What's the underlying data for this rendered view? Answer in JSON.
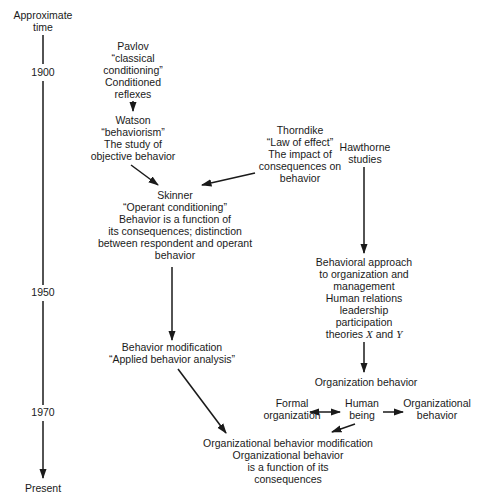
{
  "timeline": {
    "header_line1": "Approximate",
    "header_line2": "time",
    "ticks": [
      {
        "label": "1900",
        "y": 72
      },
      {
        "label": "1950",
        "y": 292
      },
      {
        "label": "1970",
        "y": 412
      }
    ],
    "end_label": "Present"
  },
  "nodes": {
    "pavlov": {
      "lines": [
        "Pavlov",
        "“classical",
        "conditioning”",
        "Conditioned",
        "reflexes"
      ]
    },
    "watson": {
      "lines": [
        "Watson",
        "“behaviorism”",
        "The study of",
        "objective behavior"
      ]
    },
    "thorndike": {
      "lines": [
        "Thorndike",
        "“Law of effect”",
        "The impact of",
        "consequences on",
        "behavior"
      ]
    },
    "hawthorne": {
      "lines": [
        "Hawthorne",
        "studies"
      ]
    },
    "skinner": {
      "lines": [
        "Skinner",
        "“Operant conditioning”",
        "Behavior is a function of",
        "its consequences; distinction",
        "between respondent and operant",
        "behavior"
      ]
    },
    "behavioral_approach": {
      "lines": [
        "Behavioral approach",
        "to organization and",
        "management",
        "Human relations",
        "leadership",
        "participation"
      ],
      "last_line": {
        "prefix": "theories ",
        "x": "X",
        "mid": " and ",
        "y": "Y"
      }
    },
    "behavior_modification": {
      "lines": [
        "Behavior modification",
        "“Applied behavior analysis”"
      ]
    },
    "organization_behavior": {
      "lines": [
        "Organization behavior"
      ]
    },
    "formal_organization": {
      "lines": [
        "Formal",
        "organization"
      ]
    },
    "human_being": {
      "lines": [
        "Human",
        "being"
      ]
    },
    "organizational_behavior": {
      "lines": [
        "Organizational",
        "behavior"
      ]
    },
    "obm": {
      "lines": [
        "Organizational behavior modification",
        "Organizational behavior",
        "is a function of its",
        "consequences"
      ]
    }
  },
  "colors": {
    "ink": "#1a1a1a",
    "background": "#ffffff"
  }
}
